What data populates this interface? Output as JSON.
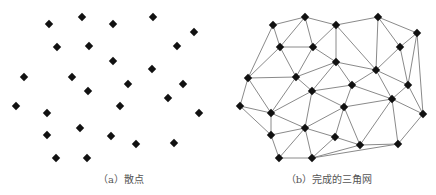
{
  "figure": {
    "panels": [
      {
        "id": "a",
        "caption": "（a）散点",
        "description": "scatter points",
        "point_color": "#111111",
        "points": [
          [
            49,
            24
          ],
          [
            82,
            17
          ],
          [
            113,
            24
          ],
          [
            153,
            17
          ],
          [
            194,
            32
          ],
          [
            57,
            47
          ],
          [
            89,
            46
          ],
          [
            177,
            46
          ],
          [
            113,
            61
          ],
          [
            152,
            69
          ],
          [
            24,
            77
          ],
          [
            72,
            77
          ],
          [
            128,
            84
          ],
          [
            183,
            84
          ],
          [
            88,
            91
          ],
          [
            168,
            98
          ],
          [
            16,
            106
          ],
          [
            47,
            113
          ],
          [
            120,
            106
          ],
          [
            199,
            113
          ],
          [
            80,
            128
          ],
          [
            47,
            135
          ],
          [
            111,
            136
          ],
          [
            136,
            144
          ],
          [
            174,
            143
          ],
          [
            56,
            158
          ],
          [
            87,
            158
          ]
        ]
      },
      {
        "id": "b",
        "caption": "（b）完成的三角网",
        "description": "completed triangulated network",
        "point_color": "#111111",
        "edge_color": "#8a8a8a",
        "points": [
          [
            273,
            25
          ],
          [
            305,
            17
          ],
          [
            336,
            25
          ],
          [
            378,
            17
          ],
          [
            417,
            33
          ],
          [
            280,
            47
          ],
          [
            313,
            47
          ],
          [
            400,
            47
          ],
          [
            336,
            62
          ],
          [
            376,
            70
          ],
          [
            248,
            78
          ],
          [
            296,
            77
          ],
          [
            352,
            85
          ],
          [
            408,
            85
          ],
          [
            312,
            91
          ],
          [
            392,
            99
          ],
          [
            240,
            106
          ],
          [
            271,
            113
          ],
          [
            344,
            107
          ],
          [
            423,
            114
          ],
          [
            305,
            128
          ],
          [
            271,
            135
          ],
          [
            335,
            137
          ],
          [
            360,
            145
          ],
          [
            398,
            144
          ],
          [
            279,
            158
          ],
          [
            312,
            158
          ]
        ],
        "edges": [
          [
            0,
            1
          ],
          [
            1,
            2
          ],
          [
            2,
            3
          ],
          [
            3,
            4
          ],
          [
            0,
            5
          ],
          [
            0,
            10
          ],
          [
            1,
            5
          ],
          [
            1,
            6
          ],
          [
            2,
            6
          ],
          [
            2,
            8
          ],
          [
            2,
            9
          ],
          [
            3,
            9
          ],
          [
            3,
            7
          ],
          [
            4,
            7
          ],
          [
            4,
            13
          ],
          [
            4,
            19
          ],
          [
            5,
            6
          ],
          [
            5,
            10
          ],
          [
            5,
            11
          ],
          [
            6,
            11
          ],
          [
            6,
            8
          ],
          [
            7,
            9
          ],
          [
            7,
            13
          ],
          [
            8,
            11
          ],
          [
            8,
            14
          ],
          [
            8,
            12
          ],
          [
            8,
            9
          ],
          [
            9,
            12
          ],
          [
            9,
            13
          ],
          [
            9,
            15
          ],
          [
            10,
            11
          ],
          [
            10,
            16
          ],
          [
            10,
            17
          ],
          [
            11,
            14
          ],
          [
            11,
            17
          ],
          [
            12,
            14
          ],
          [
            12,
            18
          ],
          [
            12,
            15
          ],
          [
            13,
            15
          ],
          [
            13,
            19
          ],
          [
            14,
            17
          ],
          [
            14,
            18
          ],
          [
            14,
            20
          ],
          [
            15,
            18
          ],
          [
            15,
            19
          ],
          [
            15,
            23
          ],
          [
            15,
            24
          ],
          [
            16,
            17
          ],
          [
            16,
            21
          ],
          [
            17,
            20
          ],
          [
            17,
            21
          ],
          [
            18,
            20
          ],
          [
            18,
            22
          ],
          [
            18,
            23
          ],
          [
            19,
            24
          ],
          [
            20,
            21
          ],
          [
            20,
            22
          ],
          [
            20,
            25
          ],
          [
            20,
            26
          ],
          [
            21,
            25
          ],
          [
            22,
            23
          ],
          [
            22,
            26
          ],
          [
            23,
            24
          ],
          [
            23,
            26
          ],
          [
            24,
            26
          ],
          [
            25,
            26
          ]
        ]
      }
    ]
  }
}
